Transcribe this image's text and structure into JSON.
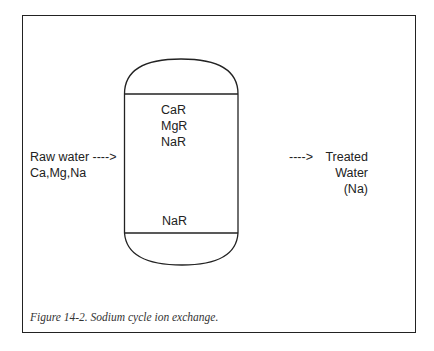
{
  "figure": {
    "caption": "Figure 14-2.  Sodium cycle ion exchange.",
    "vessel": {
      "resin_top": [
        "CaR",
        "MgR",
        "NaR"
      ],
      "resin_bottom": "NaR"
    },
    "inlet": {
      "label": "Raw water ---->",
      "ions": "Ca,Mg,Na"
    },
    "outlet": {
      "arrow": "---->",
      "label_line1": "Treated",
      "label_line2": "Water",
      "ions": "(Na)"
    },
    "colors": {
      "line": "#222222",
      "background": "#ffffff"
    }
  }
}
